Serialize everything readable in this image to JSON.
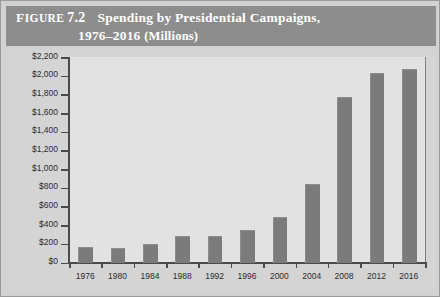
{
  "figure": {
    "label_word": "Figure",
    "number": "7.2",
    "title_line1": "Spending by Presidential Campaigns,",
    "title_line2_years": "1976–2016",
    "title_line2_units": "(Millions)"
  },
  "colors": {
    "header_band": "#8d8d8d",
    "panel_background": "#d4d4d4",
    "plot_background": "#e2e2e2",
    "bar": "#7b7b7b",
    "axis": "#4a4a4a",
    "outer_background": "#d2d2d2",
    "header_text": "#ffffff",
    "tick_text": "#2b2b2b"
  },
  "chart_data": {
    "type": "bar",
    "title": "Spending by Presidential Campaigns, 1976–2016 (Millions)",
    "xlabel": "",
    "ylabel": "",
    "categories": [
      "1976",
      "1980",
      "1984",
      "1988",
      "1992",
      "1996",
      "2000",
      "2004",
      "2008",
      "2012",
      "2016"
    ],
    "values": [
      170,
      160,
      200,
      280,
      280,
      345,
      490,
      845,
      1770,
      2030,
      2070
    ],
    "ylim": [
      0,
      2200
    ],
    "ytick_values": [
      0,
      200,
      400,
      600,
      800,
      1000,
      1200,
      1400,
      1600,
      1800,
      2000,
      2200
    ],
    "ytick_labels": [
      "$0",
      "$200",
      "$400",
      "$600",
      "$800",
      "$1,000",
      "$1,200",
      "$1,400",
      "$1,600",
      "$1,800",
      "$2,000",
      "$2,200"
    ],
    "grid": false,
    "legend": null
  }
}
